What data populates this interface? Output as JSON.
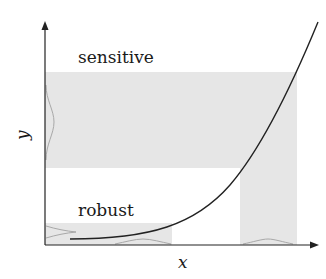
{
  "diagram": {
    "labels": {
      "sensitive": "sensitive",
      "robust": "robust",
      "x_axis": "x",
      "y_axis": "y"
    },
    "colors": {
      "shade": "#e6e6e6",
      "axis": "#222222",
      "curve": "#222222",
      "density": "#a8a8a8"
    },
    "regions": [
      {
        "name": "sensitive-output-band"
      },
      {
        "name": "robust-output-band"
      },
      {
        "name": "sensitive-input-band"
      },
      {
        "name": "robust-input-band"
      }
    ]
  }
}
